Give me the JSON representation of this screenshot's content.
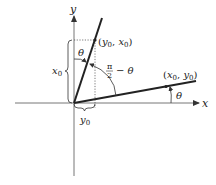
{
  "diagram": {
    "axes": {
      "x_label": "x",
      "y_label": "y"
    },
    "points": {
      "rotated": {
        "label_open": "(",
        "var1": "y",
        "sub1": "0",
        "comma": ", ",
        "var2": "x",
        "sub2": "0",
        "label_close": ")"
      },
      "original": {
        "label_open": "(",
        "var1": "x",
        "sub1": "0",
        "comma": ", ",
        "var2": "y",
        "sub2": "0",
        "label_close": ")"
      }
    },
    "angles": {
      "theta_top": "θ",
      "theta_right": "θ",
      "complement_num": "π",
      "complement_den": "2",
      "complement_rest": "− θ"
    },
    "braces": {
      "vertical": {
        "var": "x",
        "sub": "0"
      },
      "horizontal": {
        "var": "y",
        "sub": "0"
      }
    }
  }
}
